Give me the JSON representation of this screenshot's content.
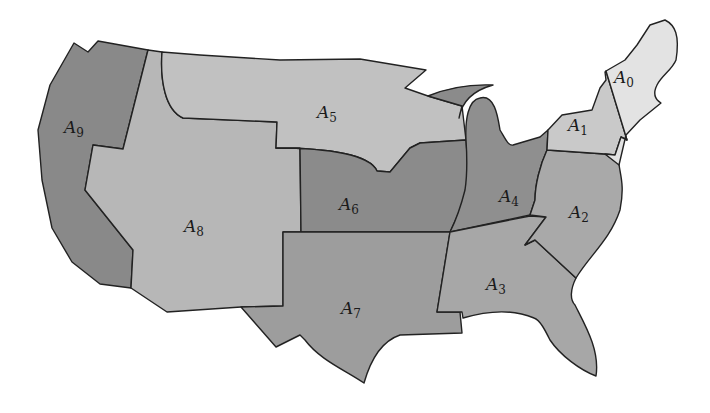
{
  "map": {
    "title": "",
    "regions": [
      {
        "id": "A0",
        "base": "A",
        "sub": "0",
        "color": "#e3e3e3",
        "label_x": 612,
        "label_y": 82
      },
      {
        "id": "A1",
        "base": "A",
        "sub": "1",
        "color": "#c9c9c9",
        "label_x": 568,
        "label_y": 131
      },
      {
        "id": "A2",
        "base": "A",
        "sub": "2",
        "color": "#a9a9a9",
        "label_x": 569,
        "label_y": 218
      },
      {
        "id": "A3",
        "base": "A",
        "sub": "3",
        "color": "#a7a7a7",
        "label_x": 486,
        "label_y": 290
      },
      {
        "id": "A4",
        "base": "A",
        "sub": "4",
        "color": "#8f8f8f",
        "label_x": 499,
        "label_y": 202
      },
      {
        "id": "A5",
        "base": "A",
        "sub": "5",
        "color": "#c1c1c1",
        "label_x": 317,
        "label_y": 118
      },
      {
        "id": "A6",
        "base": "A",
        "sub": "6",
        "color": "#8b8b8b",
        "label_x": 339,
        "label_y": 210
      },
      {
        "id": "A7",
        "base": "A",
        "sub": "7",
        "color": "#9d9d9d",
        "label_x": 341,
        "label_y": 314
      },
      {
        "id": "A8",
        "base": "A",
        "sub": "8",
        "color": "#b7b7b7",
        "label_x": 184,
        "label_y": 232
      },
      {
        "id": "A9",
        "base": "A",
        "sub": "9",
        "color": "#898989",
        "label_x": 64,
        "label_y": 133
      }
    ],
    "stroke_color": "#222222",
    "background": "#ffffff"
  }
}
